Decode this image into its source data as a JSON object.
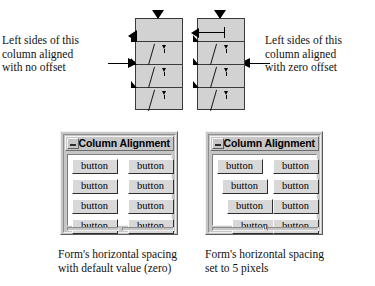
{
  "annotations": {
    "left_label": "Left sides of this\ncolumn aligned\nwith no offset",
    "right_label": "Left sides of this\ncolumn aligned\nwith zero offset",
    "left_arrow_icon": "arrow-right-icon",
    "right_arrow_icon": "arrow-left-icon"
  },
  "diagram": {
    "type": "schematic",
    "columns": [
      {
        "name": "left-column",
        "rows": 4,
        "offset_mode": "no offset"
      },
      {
        "name": "right-column",
        "rows": 4,
        "offset_mode": "zero offset"
      }
    ],
    "gutter_arrow_icon": "arrow-left-icon",
    "column_fill_color": "#d2d2d2",
    "outline_color": "#3a3a3a",
    "marker_color": "#000000"
  },
  "windows": [
    {
      "id": "win-left",
      "title": "Column Alignment",
      "minimize_icon": "minimize-icon",
      "spacing_pixels": 0,
      "rows": [
        {
          "left_button": "button",
          "right_button": "button",
          "left_offset": 0
        },
        {
          "left_button": "button",
          "right_button": "button",
          "left_offset": 0
        },
        {
          "left_button": "button",
          "right_button": "button",
          "left_offset": 0
        },
        {
          "left_button": "button",
          "right_button": "button",
          "left_offset": 0
        }
      ]
    },
    {
      "id": "win-right",
      "title": "Column Alignment",
      "minimize_icon": "minimize-icon",
      "spacing_pixels": 5,
      "rows": [
        {
          "left_button": "button",
          "right_button": "button",
          "left_offset": 0
        },
        {
          "left_button": "button",
          "right_button": "button",
          "left_offset": 5
        },
        {
          "left_button": "button",
          "right_button": "button",
          "left_offset": 10
        },
        {
          "left_button": "button",
          "right_button": "button",
          "left_offset": 15
        }
      ]
    }
  ],
  "captions": {
    "left": "Form's horizontal spacing\nwith default value (zero)",
    "right": "Form's horizontal spacing\nset to 5 pixels"
  },
  "colors": {
    "page_background": "#ffffff",
    "window_face": "#c6c6c6",
    "button_face": "#d8d8d8",
    "client_area": "#ffffff",
    "text": "#000000",
    "shadow": "#141414"
  }
}
